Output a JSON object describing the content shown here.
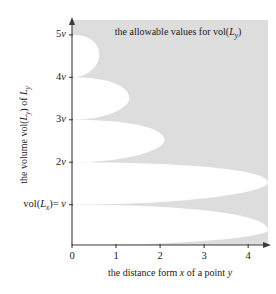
{
  "chart_data": {
    "type": "area",
    "title": "",
    "annotation": "the allowable values for vol(Lᵧ)",
    "annotation_parts": {
      "lead": "the allowable values for vol(",
      "italic_L": "L",
      "sub": "y",
      "close": ")"
    },
    "xlabel_parts": {
      "a": "the distance form ",
      "italic_x": "x",
      "b": " of a point ",
      "italic_y": "y"
    },
    "xlabel": "the distance form x of a point y",
    "ylabel": "the volume vol(Ly) of Ly",
    "ylabel_parts": {
      "a": "the volume vol(",
      "italic_L1": "L",
      "sub1": "y",
      "b": ") of ",
      "italic_L2": "L",
      "sub2": "y"
    },
    "x_ticks": [
      {
        "value": 0,
        "label": "0"
      },
      {
        "value": 1,
        "label": "1"
      },
      {
        "value": 2,
        "label": "2"
      },
      {
        "value": 3,
        "label": "3"
      },
      {
        "value": 4,
        "label": "4"
      }
    ],
    "y_ticks": [
      {
        "value": 5,
        "label": "5v",
        "italic_part": "v",
        "plain_part": "5"
      },
      {
        "value": 4,
        "label": "4v",
        "italic_part": "v",
        "plain_part": "4"
      },
      {
        "value": 3,
        "label": "3v",
        "italic_part": "v",
        "plain_part": "3"
      },
      {
        "value": 2,
        "label": "2v",
        "italic_part": "v",
        "plain_part": "2"
      },
      {
        "value": 1,
        "label": "vol(Lx)= v",
        "italic_part": "v",
        "plain_part": "vol(Lx)="
      }
    ],
    "y_tick_bottom_parts": {
      "a": "vol(",
      "italic_L": "L",
      "sub": "x",
      "b": ")= ",
      "italic_v": "v"
    },
    "xlim": [
      0,
      4.45
    ],
    "ylim": [
      0.05,
      5.35
    ],
    "grid": false,
    "legend": "none",
    "shaded_region_color": "#dddddd",
    "background_color": "#ffffff",
    "axis_color": "#3a3a3a",
    "lobes": [
      {
        "origin_y": 5.0,
        "tip_y": 4.0,
        "tip_x": 0.62,
        "peak_y": 4.52,
        "peak_x": 0.58
      },
      {
        "origin_y": 4.0,
        "tip_y": 3.0,
        "tip_x": 1.3,
        "peak_y": 3.5,
        "peak_x": 1.24
      },
      {
        "origin_y": 3.0,
        "tip_y": 2.0,
        "tip_x": 2.1,
        "peak_y": 2.52,
        "peak_x": 2.02
      },
      {
        "origin_y": 2.0,
        "tip_y": 1.0,
        "tip_x": 4.45,
        "peak_y": 1.52,
        "peak_x": 4.45
      },
      {
        "origin_y": 1.0,
        "tip_y": 0.05,
        "tip_x": 4.45,
        "peak_y": 0.4,
        "peak_x": 4.45
      }
    ]
  }
}
